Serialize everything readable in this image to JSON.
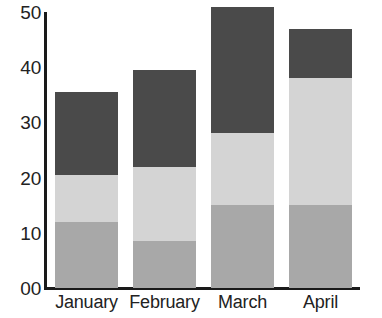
{
  "chart_data": {
    "type": "bar",
    "title": "",
    "subtitle": "",
    "xlabel": "",
    "ylabel": "",
    "stacked": true,
    "grid": false,
    "legend": "none",
    "ylim": [
      0,
      50
    ],
    "yticks": [
      0,
      10,
      20,
      30,
      40,
      50
    ],
    "ytick_labels": [
      "00",
      "10",
      "20",
      "30",
      "40",
      "50"
    ],
    "categories": [
      "January",
      "February",
      "March",
      "April"
    ],
    "series": [
      {
        "name": "bottom-segment",
        "color": "#a8a8a8",
        "values": [
          12,
          8.5,
          15,
          15
        ]
      },
      {
        "name": "middle-segment",
        "color": "#d4d4d4",
        "values": [
          8.5,
          13.5,
          13,
          23
        ]
      },
      {
        "name": "top-segment",
        "color": "#4a4a4a",
        "values": [
          15,
          17.5,
          23,
          9
        ]
      }
    ],
    "totals": [
      35.5,
      39.5,
      51,
      47
    ],
    "axis_color": "#1a1a1a",
    "background_color": "#ffffff",
    "text_color": "#222222"
  }
}
